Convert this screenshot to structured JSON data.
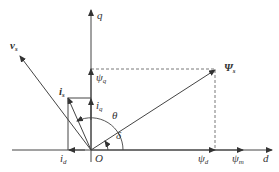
{
  "diagram": {
    "type": "phasor-diagram",
    "axes": {
      "d_label": "d",
      "q_label": "q",
      "origin_label": "O"
    },
    "vectors": {
      "psi_s": {
        "symbol": "Ψ",
        "sub": "s"
      },
      "psi_d": {
        "symbol": "ψ",
        "sub": "d"
      },
      "psi_q": {
        "symbol": "ψ",
        "sub": "q"
      },
      "psi_m": {
        "symbol": "ψ",
        "sub": "m"
      },
      "v_s": {
        "symbol": "v",
        "sub": "s"
      },
      "i_s": {
        "symbol": "i",
        "sub": "s"
      },
      "i_d": {
        "symbol": "i",
        "sub": "d"
      },
      "i_q": {
        "symbol": "i",
        "sub": "q"
      }
    },
    "angles": {
      "theta": "θ",
      "delta": "δ"
    },
    "colors": {
      "line": "#444444",
      "text": "#333333"
    }
  }
}
